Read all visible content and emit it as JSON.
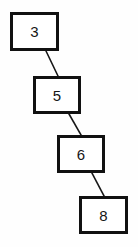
{
  "diagram": {
    "type": "linked-node-chain",
    "canvas": {
      "width": 138,
      "height": 247,
      "background": "#fefefe"
    },
    "style": {
      "node_fill": "#ffffff",
      "node_border_color": "#111111",
      "node_border_width": 3,
      "edge_color": "#161616",
      "edge_width": 1.6,
      "text_color": "#161616"
    },
    "nodes": [
      {
        "id": "n0",
        "label": "3",
        "x": 10,
        "y": 12,
        "w": 49,
        "h": 39
      },
      {
        "id": "n1",
        "label": "5",
        "x": 33,
        "y": 76,
        "w": 48,
        "h": 38
      },
      {
        "id": "n2",
        "label": "6",
        "x": 57,
        "y": 135,
        "w": 48,
        "h": 38
      },
      {
        "id": "n3",
        "label": "8",
        "x": 79,
        "y": 196,
        "w": 49,
        "h": 38
      }
    ],
    "edges": [
      {
        "id": "e0",
        "from": "n0",
        "to": "n1",
        "x1": 46,
        "y1": 51,
        "x2": 58,
        "y2": 76
      },
      {
        "id": "e1",
        "from": "n1",
        "to": "n2",
        "x1": 69,
        "y1": 114,
        "x2": 81,
        "y2": 135
      },
      {
        "id": "e2",
        "from": "n2",
        "to": "n3",
        "x1": 92,
        "y1": 173,
        "x2": 104,
        "y2": 196
      }
    ]
  }
}
